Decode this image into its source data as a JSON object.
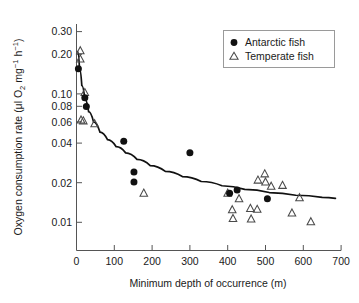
{
  "chart_data": {
    "type": "scatter",
    "title": "",
    "xlabel": "Minimum depth of occurrence (m)",
    "ylabel": "Oxygen consumption rate (μl O2 mg-1 h-1)",
    "ylabel_parts": {
      "lead": "Oxygen consumption rate (μl O",
      "sub_2": "2",
      "mid": " mg",
      "sup_1": "−1",
      "mid2": " h",
      "sup_2": "−1",
      "tail": ")"
    },
    "xlim": [
      0,
      700
    ],
    "ylim": [
      0.008,
      0.34
    ],
    "yscale": "log",
    "xscale": "linear",
    "grid": false,
    "xticks": [
      0,
      100,
      200,
      300,
      400,
      500,
      600,
      700
    ],
    "xtick_labels": [
      "0",
      "100",
      "200",
      "300",
      "400",
      "500",
      "600",
      "700"
    ],
    "yticks": [
      0.01,
      0.02,
      0.04,
      0.06,
      0.08,
      0.1,
      0.2,
      0.3
    ],
    "ytick_labels": [
      "0.01",
      "0.02",
      "0.04",
      "0.06",
      "0.08",
      "0.10",
      "0.20",
      "0.30"
    ],
    "legend_position": "top-right",
    "series": [
      {
        "name": "Antarctic fish",
        "marker": "filled-circle",
        "color": "#111111",
        "points": [
          [
            5,
            0.155
          ],
          [
            22,
            0.092
          ],
          [
            26,
            0.079
          ],
          [
            125,
            0.0425
          ],
          [
            152,
            0.0245
          ],
          [
            152,
            0.0205
          ],
          [
            300,
            0.0345
          ],
          [
            405,
            0.0168
          ],
          [
            425,
            0.0178
          ],
          [
            505,
            0.0152
          ]
        ]
      },
      {
        "name": "Temperate fish",
        "marker": "open-triangle",
        "color": "#4a4a4a",
        "points": [
          [
            10,
            0.213
          ],
          [
            10,
            0.184
          ],
          [
            22,
            0.101
          ],
          [
            12,
            0.062
          ],
          [
            18,
            0.061
          ],
          [
            48,
            0.058
          ],
          [
            178,
            0.0168
          ],
          [
            400,
            0.0168
          ],
          [
            412,
            0.0125
          ],
          [
            414,
            0.0107
          ],
          [
            430,
            0.0152
          ],
          [
            460,
            0.0128
          ],
          [
            462,
            0.0106
          ],
          [
            478,
            0.0126
          ],
          [
            480,
            0.0212
          ],
          [
            498,
            0.0237
          ],
          [
            500,
            0.0205
          ],
          [
            515,
            0.019
          ],
          [
            545,
            0.0193
          ],
          [
            570,
            0.0118
          ],
          [
            590,
            0.0155
          ],
          [
            620,
            0.0101
          ]
        ]
      }
    ],
    "fit_curve": {
      "label": "fitted power-law trend",
      "points": [
        [
          3,
          0.21
        ],
        [
          8,
          0.155
        ],
        [
          14,
          0.115
        ],
        [
          22,
          0.09
        ],
        [
          32,
          0.072
        ],
        [
          45,
          0.06
        ],
        [
          62,
          0.05
        ],
        [
          82,
          0.0437
        ],
        [
          105,
          0.0385
        ],
        [
          130,
          0.0345
        ],
        [
          160,
          0.0307
        ],
        [
          195,
          0.0275
        ],
        [
          235,
          0.0248
        ],
        [
          280,
          0.0226
        ],
        [
          330,
          0.0207
        ],
        [
          385,
          0.0192
        ],
        [
          445,
          0.018
        ],
        [
          510,
          0.017
        ],
        [
          580,
          0.0162
        ],
        [
          650,
          0.0156
        ],
        [
          685,
          0.0153
        ]
      ]
    }
  },
  "legend": {
    "entries": [
      {
        "label": "Antarctic fish",
        "marker": "filled-circle"
      },
      {
        "label": "Temperate fish",
        "marker": "open-triangle"
      }
    ]
  }
}
